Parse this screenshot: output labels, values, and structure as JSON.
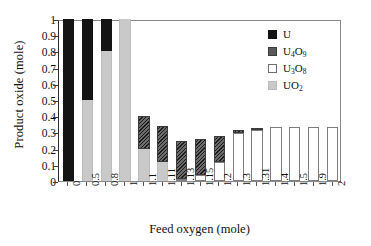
{
  "chart_data": {
    "type": "bar",
    "stacked": true,
    "title": "",
    "xlabel": "Feed oxygen (mole)",
    "ylabel": "Product oxide (mole)",
    "categories": [
      "0",
      "0.5",
      "0.8",
      "1",
      "1.1",
      "1.11",
      "1.13",
      "1.15",
      "1.2",
      "1.3",
      "1.31",
      "1.4",
      "1.5",
      "1.9",
      "2"
    ],
    "ylim": [
      0,
      1
    ],
    "yticks": [
      "0",
      "0.1",
      "0.2",
      "0.3",
      "0.4",
      "0.5",
      "0.6",
      "0.7",
      "0.8",
      "0.9",
      "1"
    ],
    "ytick_values": [
      0,
      0.1,
      0.2,
      0.3,
      0.4,
      0.5,
      0.6,
      0.7,
      0.8,
      0.9,
      1
    ],
    "grid": false,
    "legend_position": "top-right",
    "stack_order": [
      "UO2",
      "U3O8",
      "U4O9",
      "U"
    ],
    "series": [
      {
        "name": "U",
        "key": "U",
        "label_html": "U",
        "color": "#141414",
        "values": [
          1.0,
          0.5,
          0.2,
          0,
          0,
          0,
          0,
          0,
          0,
          0,
          0,
          0,
          0,
          0,
          0
        ]
      },
      {
        "name": "U4O9",
        "key": "U4O9",
        "label_html": "U<sub>4</sub>O<sub>9</sub>",
        "color": "#5a5a5a",
        "values": [
          0,
          0,
          0,
          0,
          0.2,
          0.225,
          0.235,
          0.22,
          0.16,
          0.02,
          0.015,
          0,
          0,
          0,
          0
        ]
      },
      {
        "name": "U3O8",
        "key": "U3O8",
        "label_html": "U<sub>3</sub>O<sub>8</sub>",
        "color": "#ffffff",
        "values": [
          0,
          0,
          0,
          0,
          0,
          0,
          0.015,
          0.04,
          0.115,
          0.295,
          0.315,
          0.333,
          0.333,
          0.333,
          0.333
        ]
      },
      {
        "name": "UO2",
        "key": "UO2",
        "label_html": "UO<sub>2</sub>",
        "color": "#c9c9c9",
        "values": [
          0,
          0.5,
          0.8,
          1.0,
          0.2,
          0.115,
          0,
          0,
          0,
          0,
          0,
          0,
          0,
          0,
          0
        ]
      }
    ],
    "totals": [
      1.0,
      1.0,
      1.0,
      1.0,
      0.4,
      0.34,
      0.25,
      0.26,
      0.275,
      0.315,
      0.33,
      0.333,
      0.333,
      0.333,
      0.333
    ]
  },
  "legend": {
    "items": [
      {
        "label": "U",
        "label_html": "U",
        "swatch": "s-U"
      },
      {
        "label": "U4O9",
        "label_html": "U<sub>4</sub>O<sub>9</sub>",
        "swatch": "s-U4O9"
      },
      {
        "label": "U3O8",
        "label_html": "U<sub>3</sub>O<sub>8</sub>",
        "swatch": "s-U3O8"
      },
      {
        "label": "UO2",
        "label_html": "UO<sub>2</sub>",
        "swatch": "s-UO2"
      }
    ]
  }
}
